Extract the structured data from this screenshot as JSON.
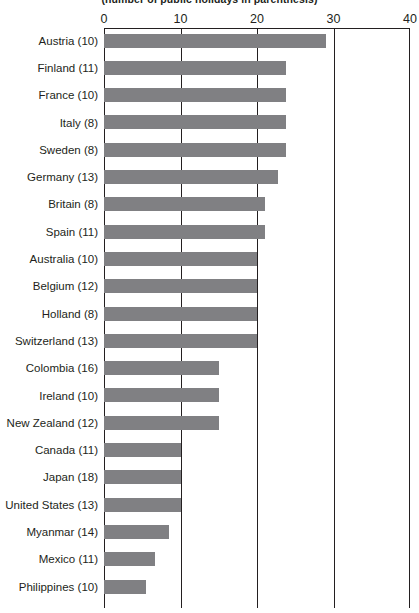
{
  "chart_data": {
    "type": "bar",
    "orientation": "horizontal",
    "title": "(number of public holidays in parenthesis)",
    "xlabel": "",
    "ylabel": "",
    "xlim": [
      0,
      40
    ],
    "xticks": [
      0,
      10,
      20,
      30,
      40
    ],
    "xtick_labels": [
      "0",
      "10",
      "20",
      "30",
      "40"
    ],
    "grid": true,
    "grid_axis": "x",
    "legend": false,
    "bar_color": "#808083",
    "axis_color": "#231f20",
    "categories": [
      "Austria (10)",
      "Finland (11)",
      "France (10)",
      "Italy (8)",
      "Sweden (8)",
      "Germany (13)",
      "Britain (8)",
      "Spain (11)",
      "Australia (10)",
      "Belgium (12)",
      "Holland (8)",
      "Switzerland (13)",
      "Colombia (16)",
      "Ireland (10)",
      "New Zealand (12)",
      "Canada (11)",
      "Japan (18)",
      "United States (13)",
      "Myanmar (14)",
      "Mexico (11)",
      "Philippines (10)"
    ],
    "values": [
      29,
      23.8,
      23.8,
      23.8,
      23.8,
      22.8,
      21,
      21,
      20,
      20,
      20,
      20,
      15,
      15,
      15,
      10,
      10,
      10,
      8.5,
      6.7,
      5.5
    ],
    "holidays": [
      10,
      11,
      10,
      8,
      8,
      13,
      8,
      11,
      10,
      12,
      8,
      13,
      16,
      10,
      12,
      11,
      18,
      13,
      14,
      11,
      10
    ]
  }
}
